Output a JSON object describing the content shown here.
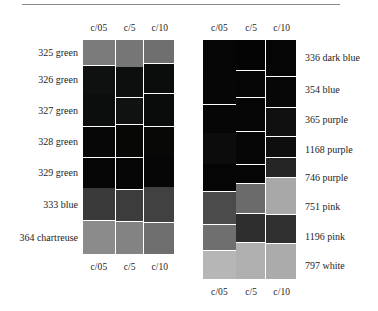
{
  "figure": {
    "rule_color": "#8a8a8a",
    "background": "#ffffff"
  },
  "panels": [
    {
      "id": "left",
      "name": "left-swatch-grid",
      "column_headers_top": [
        "c/05",
        "c/5",
        "c/10"
      ],
      "column_headers_bottom": [
        "c/05",
        "c/5",
        "c/10"
      ],
      "row_labels": [
        "325 green",
        "326 green",
        "327 green",
        "328 green",
        "329 green",
        "333 blue",
        "364 chartreuse"
      ],
      "swatches": [
        [
          "#7b7b7b",
          "#767676",
          "#6f6f6f"
        ],
        [
          "#0f1110",
          "#0d0f0e",
          "#0b0d0c"
        ],
        [
          "#0c0e0d",
          "#101211",
          "#0a0c0b"
        ],
        [
          "#060706",
          "#070806",
          "#080906"
        ],
        [
          "#040504",
          "#050605",
          "#050605"
        ],
        [
          "#3a3a3a",
          "#3c3c3c",
          "#414141"
        ],
        [
          "#8b8b8b",
          "#838383",
          "#6e6e6e"
        ]
      ]
    },
    {
      "id": "right",
      "name": "right-swatch-grid",
      "column_headers_top": [
        "c/05",
        "c/5",
        "c/10"
      ],
      "column_headers_bottom": [
        "c/05",
        "c/5",
        "c/10"
      ],
      "row_labels": [
        "336 dark blue",
        "354 blue",
        "365 purple",
        "1168 purple",
        "746 purple",
        "751 pink",
        "1196 pink",
        "797 white"
      ],
      "swatches": [
        [
          "#050505",
          "#040404",
          "#050505"
        ],
        [
          "#060606",
          "#050505",
          "#070707"
        ],
        [
          "#060606",
          "#060606",
          "#101010"
        ],
        [
          "#0c0c0c",
          "#060606",
          "#0e0e0e"
        ],
        [
          "#050505",
          "#050505",
          "#252525"
        ],
        [
          "#4b4b4b",
          "#6b6b6b",
          "#a8a8a8"
        ],
        [
          "#6f6f6f",
          "#2e2e2e",
          "#303030"
        ],
        [
          "#b6b6b6",
          "#b0b0b0",
          "#ababab"
        ]
      ]
    }
  ]
}
